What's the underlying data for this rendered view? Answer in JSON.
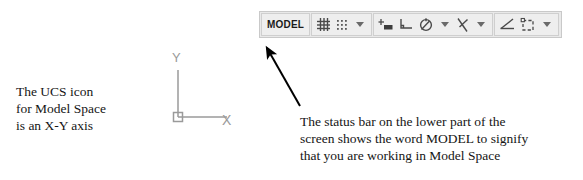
{
  "status_bar": {
    "mode_label": "MODEL",
    "items": [
      {
        "name": "grid-display",
        "icon": "grid-icon",
        "has_dropdown": false
      },
      {
        "name": "snap-mode",
        "icon": "snap-dots-icon",
        "has_dropdown": true
      },
      {
        "name": "dynamic-input",
        "icon": "dynamic-input-icon",
        "has_dropdown": false
      },
      {
        "name": "ortho-mode",
        "icon": "ortho-l-icon",
        "has_dropdown": false
      },
      {
        "name": "polar-tracking",
        "icon": "polar-tracking-icon",
        "has_dropdown": true
      },
      {
        "name": "object-snap",
        "icon": "object-snap-icon",
        "has_dropdown": true
      },
      {
        "name": "angle-constraint",
        "icon": "angle-icon",
        "has_dropdown": false
      },
      {
        "name": "annotation-scale",
        "icon": "dashed-square-icon",
        "has_dropdown": true
      }
    ]
  },
  "ucs_icon": {
    "y_axis_label": "Y",
    "x_axis_label": "X",
    "origin_marker": "square"
  },
  "captions": {
    "ucs": [
      "The UCS icon",
      "for Model Space",
      "is an X-Y axis"
    ],
    "status": [
      "The status bar on the lower part of the",
      "screen shows the word MODEL to signify",
      "that you are working in Model Space"
    ]
  },
  "colors": {
    "toolbar_background": "#e9e9e9",
    "toolbar_border": "#c9c9c9",
    "button_face": "#eeeeee",
    "icon_stroke": "#4a4a4a",
    "ucs_stroke": "#9a9a9a",
    "arrow": "#000000",
    "text": "#151515"
  }
}
